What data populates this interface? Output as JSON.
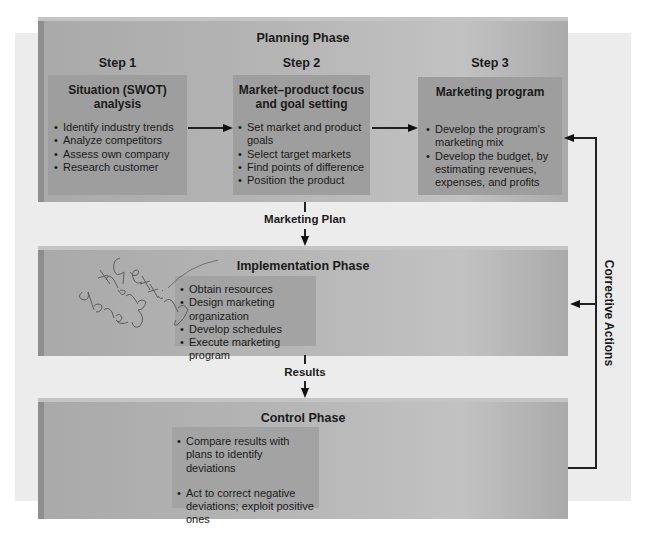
{
  "planning_phase": {
    "title": "Planning Phase",
    "steps": [
      {
        "label": "Step 1",
        "title": "Situation (SWOT) analysis",
        "title_lines": [
          "Situation (SWOT)",
          "analysis"
        ],
        "items": [
          "Identify industry trends",
          "Analyze competitors",
          "Assess own company",
          "Research customer"
        ]
      },
      {
        "label": "Step 2",
        "title": "Market–product focus and goal setting",
        "title_lines": [
          "Market–product focus",
          "and goal setting"
        ],
        "items": [
          "Set market and product goals",
          "Select target markets",
          "Find points of difference",
          "Position the product"
        ]
      },
      {
        "label": "Step 3",
        "title": "Marketing program",
        "title_lines": [
          "Marketing program"
        ],
        "items": [
          "Develop the program's marketing mix",
          "Develop the budget, by estimating revenues, expenses, and profits"
        ]
      }
    ]
  },
  "connectors": {
    "planning_to_implementation": "Marketing Plan",
    "implementation_to_control": "Results",
    "feedback": "Corrective Actions"
  },
  "implementation_phase": {
    "title": "Implementation Phase",
    "items": [
      "Obtain resources",
      "Design marketing organization",
      "Develop schedules",
      "Execute marketing program"
    ],
    "handwritten_note": "Getting things done"
  },
  "control_phase": {
    "title": "Control Phase",
    "items": [
      "Compare results with plans to identify deviations",
      "Act to correct negative deviations; exploit positive ones"
    ]
  },
  "colors": {
    "background_panel": "#ececec",
    "phase_band": "#b5b5b5",
    "inner_box": "#9e9e9e",
    "line": "#222222"
  }
}
